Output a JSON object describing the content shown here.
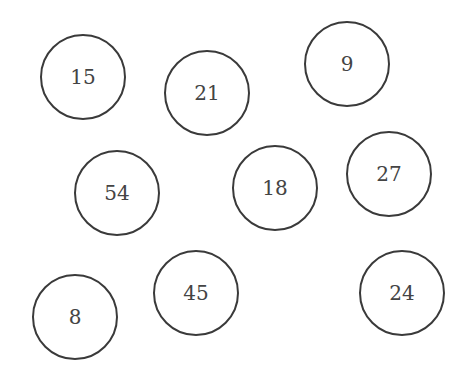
{
  "diagram": {
    "type": "number-circles",
    "circles": [
      {
        "label": "15",
        "cx": 83,
        "cy": 77
      },
      {
        "label": "21",
        "cx": 207,
        "cy": 93
      },
      {
        "label": "9",
        "cx": 347,
        "cy": 64
      },
      {
        "label": "54",
        "cx": 117,
        "cy": 193
      },
      {
        "label": "18",
        "cx": 275,
        "cy": 188
      },
      {
        "label": "27",
        "cx": 389,
        "cy": 174
      },
      {
        "label": "8",
        "cx": 75,
        "cy": 317
      },
      {
        "label": "45",
        "cx": 196,
        "cy": 293
      },
      {
        "label": "24",
        "cx": 402,
        "cy": 293
      }
    ],
    "radius": 44,
    "stroke_color": "#3a3a3a",
    "text_color": "#444444"
  }
}
